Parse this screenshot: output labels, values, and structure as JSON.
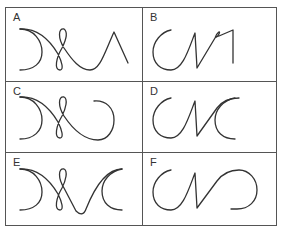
{
  "figure": {
    "panels": [
      {
        "id": "A",
        "label": "A",
        "description": "Left-facing arc joined to a figure-eight loop, a dip, then a sharp peak (triangle) on the right"
      },
      {
        "id": "B",
        "label": "B",
        "description": "Open C-shaped arc joined to a zigzag with a small loop at the top and a vertical stroke on the right"
      },
      {
        "id": "C",
        "label": "C",
        "description": "Left-facing arc joined to a figure-eight loop and a sweeping curve ending in a right-facing arc"
      },
      {
        "id": "D",
        "label": "D",
        "description": "Open C-shaped arc, a zigzag, and an overlapping pair of C arcs on the right"
      },
      {
        "id": "E",
        "label": "E",
        "description": "Left-facing arc, a figure-eight loop, a V dip, and a C-shaped arc on the right"
      },
      {
        "id": "F",
        "label": "F",
        "description": "Open C-shaped arc, a zigzag, and a right-facing rounded arc (S / infinity-like shape)"
      }
    ]
  }
}
